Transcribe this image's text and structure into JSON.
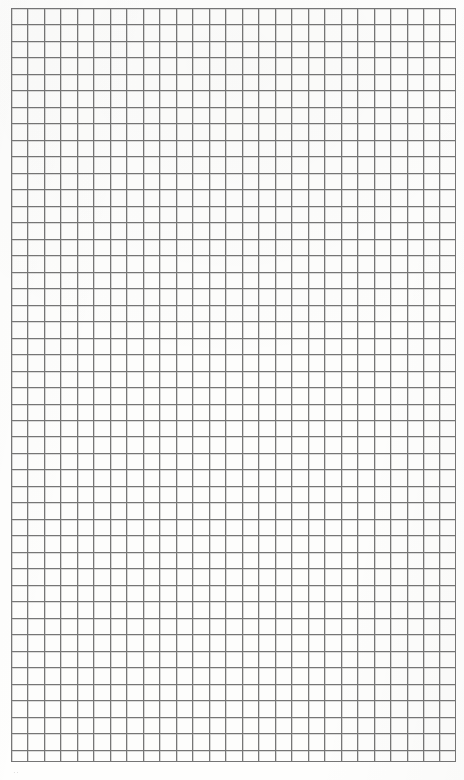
{
  "document": {
    "kind": "graph-paper-sheet",
    "title": "Blank quadrille graph paper sheet",
    "page_width": 464,
    "page_height": 780,
    "page_background": "#ffffff",
    "paper_background": "#fefefd"
  },
  "grid": {
    "label": "graph-paper-grid",
    "origin_x": 11,
    "origin_y": 8,
    "width": 445,
    "height": 754,
    "columns": 27,
    "rows": 46,
    "cell_size": 16.48,
    "line_color": "#767676",
    "line_width": 1,
    "border_color": "#767676",
    "border_width": 1,
    "cell_fill": "#fdfdfc",
    "sub_divisions": 0,
    "is_blank": true,
    "content_marks": 0
  },
  "annotations": {
    "page_mark_text": "··",
    "page_mark_x": 13,
    "page_mark_y": 768,
    "page_mark_color": "#b9b9b9",
    "page_mark_note": "faint illegible scan mark below grid"
  }
}
